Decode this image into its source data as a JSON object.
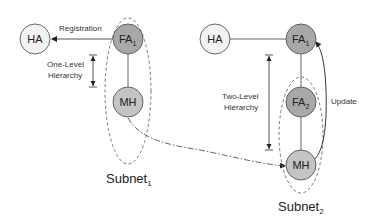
{
  "diagram": {
    "colors": {
      "ha_fill": "#f2f2f2",
      "fa_fill": "#a8a8a8",
      "mh_fill": "#c4c4c4",
      "stroke": "#555555",
      "dashed": "#666666"
    },
    "left": {
      "ha": {
        "label": "HA"
      },
      "fa1": {
        "label": "FA",
        "sub": "1"
      },
      "mh": {
        "label": "MH"
      },
      "registration_label": "Registration",
      "hierarchy_label_line1": "One-Level",
      "hierarchy_label_line2": "Hierarchy",
      "subnet_label": "Subnet",
      "subnet_sub": "1"
    },
    "right": {
      "ha": {
        "label": "HA"
      },
      "fa1": {
        "label": "FA",
        "sub": "1"
      },
      "fa2": {
        "label": "FA",
        "sub": "2"
      },
      "mh": {
        "label": "MH"
      },
      "update_label": "Update",
      "hierarchy_label_line1": "Two-Level",
      "hierarchy_label_line2": "Hierarchy",
      "subnet_label": "Subnet",
      "subnet_sub": "2"
    }
  }
}
